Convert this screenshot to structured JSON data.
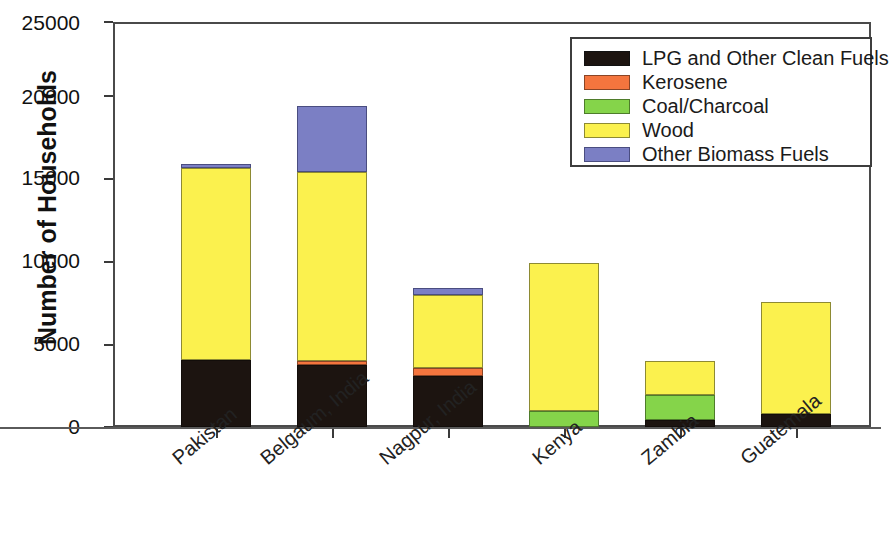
{
  "chart_data": {
    "type": "bar",
    "stacked": true,
    "title": "",
    "xlabel": "",
    "ylabel": "Number of Households",
    "ylim": [
      0,
      25000
    ],
    "ytick_values": [
      0,
      5000,
      10000,
      15000,
      20000,
      25000
    ],
    "ytick_labels": [
      "0",
      "5000",
      "10000",
      "15000",
      "20000",
      "25000"
    ],
    "grid": false,
    "legend_position": "top-right",
    "categories": [
      "Pakistan",
      "Belgaum, India",
      "Nagpur, India",
      "Kenya",
      "Zambia",
      "Guatemala"
    ],
    "series": [
      {
        "name": "LPG and Other Clean Fuels",
        "color": "#1c1410",
        "values": [
          4150,
          3850,
          3150,
          0,
          450,
          800
        ]
      },
      {
        "name": "Kerosene",
        "color": "#f4753e",
        "values": [
          0,
          250,
          500,
          0,
          0,
          0
        ]
      },
      {
        "name": "Coal/Charcoal",
        "color": "#85d44a",
        "values": [
          0,
          0,
          0,
          1000,
          1500,
          0
        ]
      },
      {
        "name": "Wood",
        "color": "#fbf14e",
        "values": [
          11850,
          11650,
          4500,
          9100,
          2100,
          6900
        ]
      },
      {
        "name": "Other Biomass Fuels",
        "color": "#7b7fc4",
        "values": [
          250,
          4050,
          400,
          0,
          0,
          0
        ]
      }
    ],
    "totals": [
      16250,
      19800,
      8550,
      10100,
      4050,
      7700
    ]
  },
  "axis": {
    "ylabel": "Number of Households",
    "ytick_0": "0",
    "ytick_1": "5000",
    "ytick_2": "10000",
    "ytick_3": "15000",
    "ytick_4": "20000",
    "ytick_5": "25000"
  },
  "xlabels": {
    "c0": "Pakistan",
    "c1": "Belgaum, India",
    "c2": "Nagpur, India",
    "c3": "Kenya",
    "c4": "Zambia",
    "c5": "Guatemala"
  },
  "legend": {
    "items": [
      {
        "label": "LPG and Other Clean Fuels",
        "color": "#1c1410"
      },
      {
        "label": "Kerosene",
        "color": "#f4753e"
      },
      {
        "label": "Coal/Charcoal",
        "color": "#85d44a"
      },
      {
        "label": "Wood",
        "color": "#fbf14e"
      },
      {
        "label": "Other Biomass Fuels",
        "color": "#7b7fc4"
      }
    ]
  }
}
